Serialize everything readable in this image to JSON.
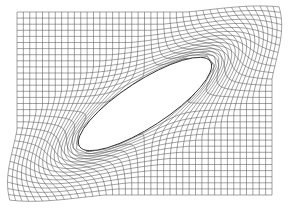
{
  "figure": {
    "title": "",
    "width": 288,
    "height": 212,
    "background": "#ffffff",
    "line_color": "#555555",
    "body_color": "#333333"
  },
  "mesh": {
    "domain": {
      "x0": 17,
      "x1": 272,
      "y0": 12,
      "y1": 195
    },
    "columns": 40,
    "rows": 30,
    "influence_radius": 55
  },
  "body": {
    "shape": "ellipse",
    "cx": 145,
    "cy": 104,
    "semi_major": 78,
    "semi_minor": 23,
    "rotation_deg": -33
  }
}
